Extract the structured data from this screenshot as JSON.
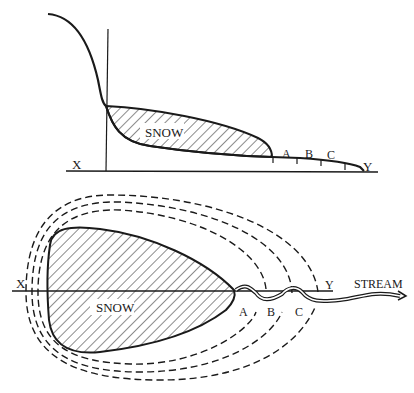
{
  "colors": {
    "ink": "#1a1a1a",
    "background": "#ffffff"
  },
  "section_view": {
    "labels": {
      "x": "X",
      "y": "Y",
      "snow": "SNOW",
      "a": "A",
      "b": "B",
      "c": "C"
    }
  },
  "plan_view": {
    "labels": {
      "x": "X",
      "y": "Y",
      "snow": "SNOW",
      "a": "A",
      "b": "B",
      "c": "C",
      "stream": "STREAM"
    },
    "dashed_contours": 3
  }
}
